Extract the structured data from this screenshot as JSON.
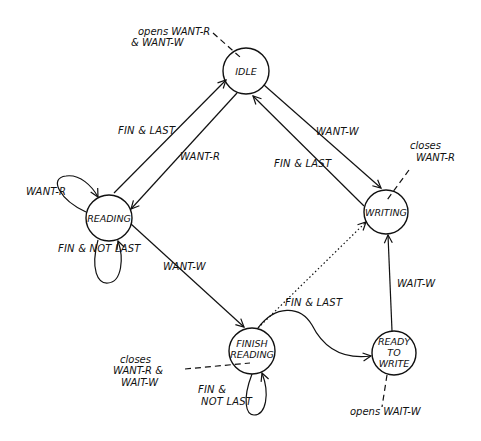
{
  "diagram": {
    "type": "state-machine",
    "colors": {
      "ink": "#111111",
      "background": "#ffffff"
    },
    "states": [
      {
        "id": "idle",
        "label": [
          "IDLE"
        ],
        "cx": 246,
        "cy": 71,
        "r": 23
      },
      {
        "id": "reading",
        "label": [
          "READING"
        ],
        "cx": 109,
        "cy": 218,
        "r": 23
      },
      {
        "id": "writing",
        "label": [
          "WRITING"
        ],
        "cx": 386,
        "cy": 212,
        "r": 22
      },
      {
        "id": "finish_reading",
        "label": [
          "FINISH",
          "READING"
        ],
        "cx": 252,
        "cy": 351,
        "r": 23
      },
      {
        "id": "ready_to_write",
        "label": [
          "READY",
          "TO",
          "WRITE"
        ],
        "cx": 394,
        "cy": 353,
        "r": 22
      }
    ],
    "transitions": [
      {
        "from": "reading",
        "to": "idle",
        "label": "FIN & LAST"
      },
      {
        "from": "idle",
        "to": "reading",
        "label": "WANT-R"
      },
      {
        "from": "reading",
        "to": "reading",
        "label": "WANT-R"
      },
      {
        "from": "reading",
        "to": "reading",
        "label": "FIN & NOT LAST"
      },
      {
        "from": "idle",
        "to": "writing",
        "label": "WANT-W"
      },
      {
        "from": "writing",
        "to": "idle",
        "label": "FIN & LAST"
      },
      {
        "from": "reading",
        "to": "finish_reading",
        "label": "WANT-W"
      },
      {
        "from": "finish_reading",
        "to": "finish_reading",
        "label": "FIN & NOT LAST"
      },
      {
        "from": "finish_reading",
        "to": "ready_to_write",
        "label": "FIN & LAST"
      },
      {
        "from": "finish_reading",
        "to": "writing",
        "label": "",
        "style": "dotted"
      },
      {
        "from": "ready_to_write",
        "to": "writing",
        "label": "WAIT-W"
      }
    ],
    "annotations": [
      {
        "state": "idle",
        "lines": [
          "opens WANT-R",
          "& WANT-W"
        ]
      },
      {
        "state": "writing",
        "lines": [
          "closes",
          "WANT-R"
        ]
      },
      {
        "state": "finish_reading",
        "lines": [
          "closes",
          "WANT-R &",
          "WAIT-W"
        ]
      },
      {
        "state": "ready_to_write",
        "lines": [
          "opens WAIT-W"
        ]
      }
    ]
  }
}
